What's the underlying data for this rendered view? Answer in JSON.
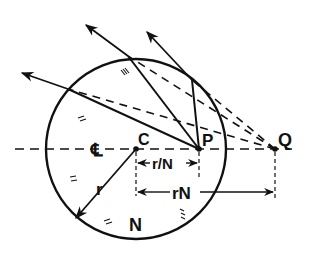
{
  "diagram": {
    "labels": {
      "center": "C",
      "inner_point": "P",
      "outer_point": "Q",
      "centerline": "℄",
      "radius": "r",
      "inner_distance": "r/N",
      "outer_distance": "rN",
      "medium": "N"
    },
    "geometry": {
      "circle_center": [
        136,
        149
      ],
      "circle_radius": 90,
      "point_P": [
        199,
        149
      ],
      "point_Q": [
        275,
        149
      ],
      "surface_points": [
        [
          68,
          89
        ],
        [
          128,
          56
        ],
        [
          192,
          80
        ]
      ],
      "ray_arrow_tips": [
        [
          22,
          73
        ],
        [
          86,
          25
        ],
        [
          145,
          30
        ]
      ]
    },
    "colors": {
      "ink": "#111111",
      "background": "#ffffff"
    }
  }
}
